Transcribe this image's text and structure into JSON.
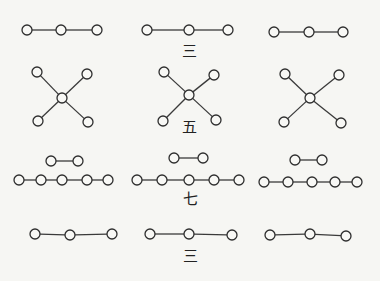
{
  "canvas": {
    "width": 380,
    "height": 281,
    "background": "#f6f6f3",
    "ink": "#2e2e2e"
  },
  "labels": [
    {
      "id": "label-san-top",
      "text": "三",
      "x": 189,
      "y": 51
    },
    {
      "id": "label-wu",
      "text": "五",
      "x": 189,
      "y": 127
    },
    {
      "id": "label-qi",
      "text": "七",
      "x": 190,
      "y": 199
    },
    {
      "id": "label-san-bottom",
      "text": "三",
      "x": 190,
      "y": 256
    }
  ],
  "figures": [
    {
      "name": "row1-left-line-of-3",
      "nodes": [
        [
          27,
          30
        ],
        [
          61,
          30
        ],
        [
          97,
          30
        ]
      ],
      "edges": [
        [
          0,
          1
        ],
        [
          1,
          2
        ]
      ]
    },
    {
      "name": "row1-middle-line-of-3",
      "nodes": [
        [
          147,
          30
        ],
        [
          189,
          30
        ],
        [
          228,
          30
        ]
      ],
      "edges": [
        [
          0,
          1
        ],
        [
          1,
          2
        ]
      ]
    },
    {
      "name": "row1-right-line-of-3",
      "nodes": [
        [
          274,
          32
        ],
        [
          309,
          32
        ],
        [
          343,
          32
        ]
      ],
      "edges": [
        [
          0,
          1
        ],
        [
          1,
          2
        ]
      ]
    },
    {
      "name": "row2-left-x-of-5",
      "nodes": [
        [
          37,
          72
        ],
        [
          87,
          74
        ],
        [
          62,
          98
        ],
        [
          38,
          121
        ],
        [
          88,
          122
        ]
      ],
      "edges": [
        [
          0,
          2
        ],
        [
          1,
          2
        ],
        [
          2,
          3
        ],
        [
          2,
          4
        ]
      ]
    },
    {
      "name": "row2-middle-x-of-5",
      "nodes": [
        [
          164,
          72
        ],
        [
          214,
          75
        ],
        [
          189,
          95
        ],
        [
          163,
          121
        ],
        [
          216,
          120
        ]
      ],
      "edges": [
        [
          0,
          2
        ],
        [
          1,
          2
        ],
        [
          2,
          3
        ],
        [
          2,
          4
        ]
      ]
    },
    {
      "name": "row2-right-x-of-5",
      "nodes": [
        [
          285,
          74
        ],
        [
          339,
          75
        ],
        [
          310,
          98
        ],
        [
          284,
          122
        ],
        [
          341,
          123
        ]
      ],
      "edges": [
        [
          0,
          2
        ],
        [
          1,
          2
        ],
        [
          2,
          3
        ],
        [
          2,
          4
        ]
      ]
    },
    {
      "name": "row3-left-pair",
      "nodes": [
        [
          51,
          161
        ],
        [
          78,
          161
        ]
      ],
      "edges": [
        [
          0,
          1
        ]
      ]
    },
    {
      "name": "row3-left-line-of-5",
      "nodes": [
        [
          19,
          180
        ],
        [
          41,
          180
        ],
        [
          62,
          180
        ],
        [
          87,
          180
        ],
        [
          108,
          180
        ]
      ],
      "edges": [
        [
          0,
          1
        ],
        [
          1,
          2
        ],
        [
          2,
          3
        ],
        [
          3,
          4
        ]
      ]
    },
    {
      "name": "row3-middle-pair",
      "nodes": [
        [
          174,
          158
        ],
        [
          203,
          158
        ]
      ],
      "edges": [
        [
          0,
          1
        ]
      ]
    },
    {
      "name": "row3-middle-line-of-5",
      "nodes": [
        [
          137,
          180
        ],
        [
          162,
          180
        ],
        [
          189,
          180
        ],
        [
          214,
          180
        ],
        [
          239,
          180
        ]
      ],
      "edges": [
        [
          0,
          1
        ],
        [
          1,
          2
        ],
        [
          2,
          3
        ],
        [
          3,
          4
        ]
      ]
    },
    {
      "name": "row3-right-pair",
      "nodes": [
        [
          295,
          160
        ],
        [
          322,
          160
        ]
      ],
      "edges": [
        [
          0,
          1
        ]
      ]
    },
    {
      "name": "row3-right-line-of-5",
      "nodes": [
        [
          264,
          182
        ],
        [
          288,
          182
        ],
        [
          312,
          182
        ],
        [
          335,
          182
        ],
        [
          357,
          182
        ]
      ],
      "edges": [
        [
          0,
          1
        ],
        [
          1,
          2
        ],
        [
          2,
          3
        ],
        [
          3,
          4
        ]
      ]
    },
    {
      "name": "row4-left-line-of-3",
      "nodes": [
        [
          35,
          234
        ],
        [
          70,
          235
        ],
        [
          112,
          234
        ]
      ],
      "edges": [
        [
          0,
          1
        ],
        [
          1,
          2
        ]
      ]
    },
    {
      "name": "row4-middle-line-of-3",
      "nodes": [
        [
          150,
          234
        ],
        [
          189,
          234
        ],
        [
          232,
          235
        ]
      ],
      "edges": [
        [
          0,
          1
        ],
        [
          1,
          2
        ]
      ]
    },
    {
      "name": "row4-right-line-of-3",
      "nodes": [
        [
          270,
          235
        ],
        [
          310,
          234
        ],
        [
          346,
          236
        ]
      ],
      "edges": [
        [
          0,
          1
        ],
        [
          1,
          2
        ]
      ]
    }
  ],
  "node_radius": 5
}
